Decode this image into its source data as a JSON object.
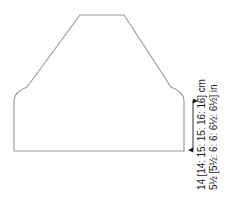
{
  "diagram": {
    "piece_name": "sleeve-or-body-panel",
    "line_color": "#9a9a9a",
    "arrow_color": "#1a1a1a",
    "text_color": "#1a1a1a",
    "background_color": "#ffffff"
  },
  "outline": {
    "shape_name": "raglan-tapered-panel",
    "path": "M 14 151 L 14 101 C 14 95 19 90 27 87 L 80 15 L 124 15 L 171 87 C 179 90 184 95 184 101 L 184 151 Z",
    "bottom_edge_y": 151,
    "left_edge_x": 14,
    "right_edge_x": 184,
    "top_edge_y": 15,
    "top_edge_left_x": 80,
    "top_edge_right_x": 124,
    "side_seam_top_y": 101
  },
  "dimension": {
    "name": "side-seam-height",
    "arrow_x": 193,
    "arrow_top_y": 100,
    "arrow_bottom_y": 151,
    "labels": {
      "metric": "14 [14: 15: 15: 16: 16] cm",
      "imperial": "5½ [5½: 6: 6: 6½: 6½] in"
    },
    "values_cm": [
      14,
      14,
      15,
      15,
      16,
      16
    ],
    "values_in": [
      "5½",
      "5½",
      "6",
      "6",
      "6½",
      "6½"
    ],
    "unit_metric": "cm",
    "unit_imperial": "in"
  }
}
